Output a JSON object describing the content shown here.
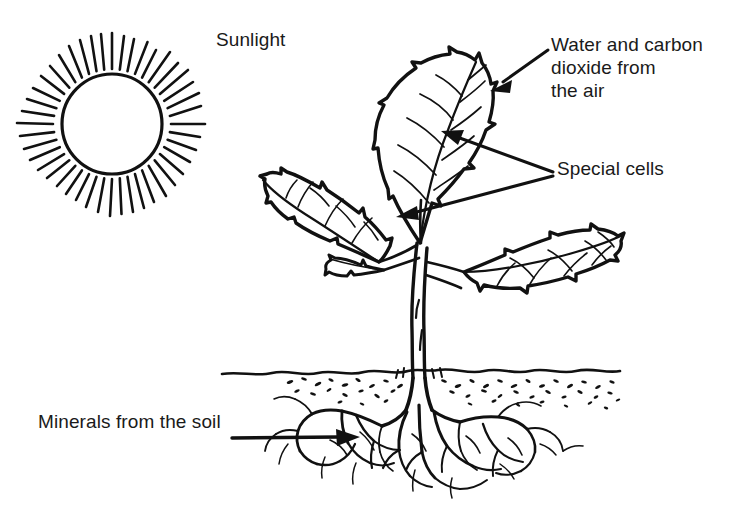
{
  "figure": {
    "type": "line-drawing",
    "background_color": "#ffffff",
    "ink_color": "#111111"
  },
  "labels": {
    "sunlight": "Sunlight",
    "water_carbon_dioxide": "Water and carbon\ndioxide from\nthe air",
    "special_cells": "Special cells",
    "minerals": "Minerals from the soil"
  },
  "diagram_elements": {
    "sun": {
      "name": "sun",
      "center_x": 112,
      "center_y": 124,
      "radius": 50,
      "ray_count": 44
    },
    "plant": {
      "name": "plant",
      "leaf_count": 4,
      "stem": "double-outline tapering stem"
    },
    "soil": {
      "name": "soil-line",
      "y": 375,
      "style": "wavy line with stipple dots"
    },
    "roots": {
      "name": "root-system",
      "style": "branching fibrous roots"
    },
    "arrows": [
      {
        "name": "arrow-water-carbon",
        "points_to": "top-leaf-tip"
      },
      {
        "name": "arrow-special-cells-upper",
        "points_to": "leaf-midblade"
      },
      {
        "name": "arrow-special-cells-lower",
        "points_to": "leaf-base"
      },
      {
        "name": "arrow-minerals",
        "points_to": "roots"
      }
    ]
  }
}
